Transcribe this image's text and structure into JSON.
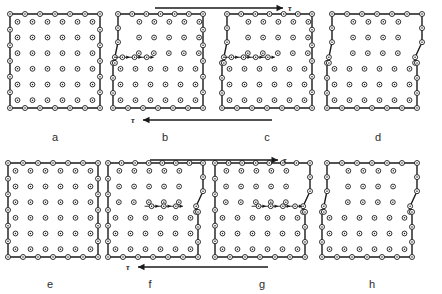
{
  "figure": {
    "type": "diagram",
    "background_color": "#ffffff",
    "line_color": "#1a1a1a",
    "atom_fill": "#ffffff",
    "atom_stroke": "#1a1a1a",
    "rows": 2,
    "columns": 4,
    "panels": [
      {
        "id": "a",
        "label": "a",
        "label_x": 55,
        "label_y": 131,
        "state": "undeformed",
        "lattice_cols": 7,
        "lattice_rows": 7,
        "left_step": false,
        "right_step": false,
        "dislocation_row": null,
        "glide_arrows": 0
      },
      {
        "id": "b",
        "label": "b",
        "label_x": 165,
        "label_y": 131,
        "state": "dislocation-entering-left",
        "lattice_cols": 7,
        "lattice_rows": 7,
        "left_step": true,
        "right_step": false,
        "dislocation_row": 3,
        "glide_arrows": 3
      },
      {
        "id": "c",
        "label": "c",
        "label_x": 267,
        "label_y": 131,
        "state": "dislocation-mid-glide",
        "lattice_cols": 7,
        "lattice_rows": 7,
        "left_step": true,
        "right_step": false,
        "dislocation_row": 3,
        "glide_arrows": 4
      },
      {
        "id": "d",
        "label": "d",
        "label_x": 378,
        "label_y": 131,
        "state": "slip-step-formed",
        "lattice_cols": 7,
        "lattice_rows": 7,
        "left_step": true,
        "right_step": true,
        "dislocation_row": null,
        "glide_arrows": 0
      },
      {
        "id": "e",
        "label": "e",
        "label_x": 50,
        "label_y": 278,
        "state": "undeformed",
        "lattice_cols": 7,
        "lattice_rows": 7,
        "left_step": false,
        "right_step": false,
        "dislocation_row": null,
        "glide_arrows": 0
      },
      {
        "id": "f",
        "label": "f",
        "label_x": 150,
        "label_y": 278,
        "state": "dislocation-entering-right",
        "lattice_cols": 7,
        "lattice_rows": 7,
        "left_step": false,
        "right_step": true,
        "dislocation_row": 3,
        "glide_arrows": 3
      },
      {
        "id": "g",
        "label": "g",
        "label_x": 262,
        "label_y": 278,
        "state": "dislocation-mid-glide",
        "lattice_cols": 7,
        "lattice_rows": 7,
        "left_step": false,
        "right_step": true,
        "dislocation_row": 3,
        "glide_arrows": 4
      },
      {
        "id": "h",
        "label": "h",
        "label_x": 372,
        "label_y": 278,
        "state": "slip-step-formed",
        "lattice_cols": 7,
        "lattice_rows": 7,
        "left_step": true,
        "right_step": true,
        "dislocation_row": null,
        "glide_arrows": 0
      }
    ],
    "stress_arrows": [
      {
        "id": "tau-top-row1",
        "symbol": "τ",
        "direction": "right",
        "x1": 155,
        "x2": 283,
        "y": 8,
        "label_x": 288,
        "label_y": 4
      },
      {
        "id": "tau-bottom-row1",
        "symbol": "τ",
        "direction": "left",
        "x1": 143,
        "x2": 272,
        "y": 120,
        "label_x": 131,
        "label_y": 116
      },
      {
        "id": "tau-top-row2",
        "symbol": "τ",
        "direction": "right",
        "x1": 150,
        "x2": 278,
        "y": 160,
        "label_x": 283,
        "label_y": 156
      },
      {
        "id": "tau-bottom-row2",
        "symbol": "τ",
        "direction": "left",
        "x1": 138,
        "x2": 268,
        "y": 267,
        "label_x": 126,
        "label_y": 263
      }
    ]
  }
}
